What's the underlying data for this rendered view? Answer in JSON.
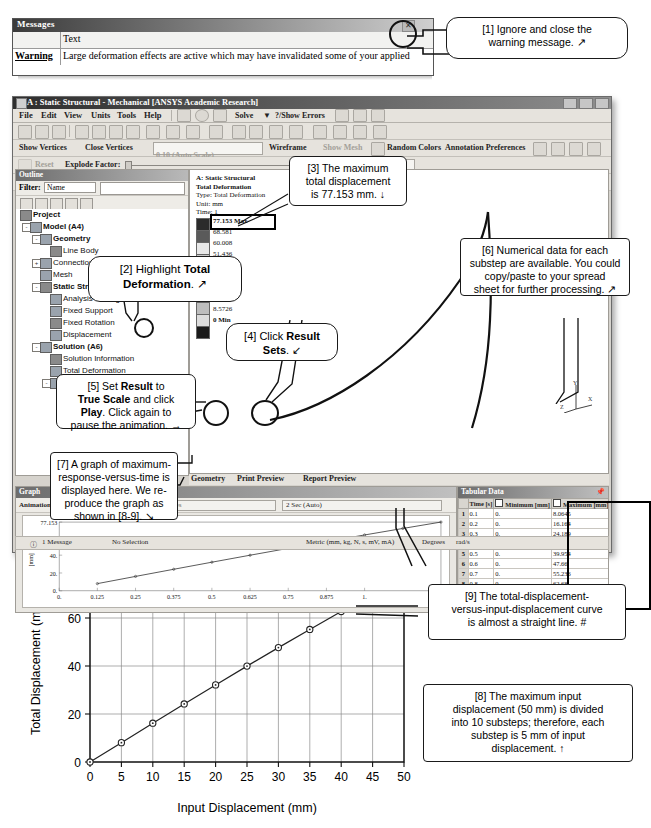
{
  "message_window": {
    "title": "Messages",
    "close_icon": "close-icon",
    "column_header_blank": "",
    "column_header_text": "Text",
    "row_type": "Warning",
    "row_text": "Large deformation effects are active which may have invalidated some of your applied"
  },
  "ansys": {
    "title": "A : Static Structural - Mechanical [ANSYS Academic Research]",
    "window_buttons": [
      "minimize",
      "maximize",
      "close"
    ],
    "menu": [
      "File",
      "Edit",
      "View",
      "Units",
      "Tools",
      "Help"
    ],
    "toolbar1": [
      "Solve",
      "?/Show Errors",
      "Worksheet"
    ],
    "toolbar2": [
      "Show Vertices",
      "Close Vertices",
      "0.10 (Auto Scale)",
      "Wireframe",
      "Show Mesh",
      "Random Colors",
      "Annotation Preferences"
    ],
    "toolbar3": [
      "Reset",
      "Explode Factor:",
      "Assembly Center"
    ],
    "toolbar4": [
      "Result",
      "1.0 (True Scale)",
      "Probe",
      "Display"
    ],
    "tree": {
      "filter_label": "Filter:",
      "filter_value": "Name",
      "items": [
        {
          "label": "Project",
          "depth": 0,
          "expander": "",
          "icon": "project-icon",
          "bold": true
        },
        {
          "label": "Model (A4)",
          "depth": 1,
          "expander": "-",
          "icon": "model-icon",
          "bold": true
        },
        {
          "label": "Geometry",
          "depth": 2,
          "expander": "-",
          "icon": "geometry-icon",
          "bold": true
        },
        {
          "label": "Line Body",
          "depth": 3,
          "expander": "",
          "icon": "body-icon",
          "bold": false
        },
        {
          "label": "Connections",
          "depth": 2,
          "expander": "+",
          "icon": "connections-icon",
          "bold": false
        },
        {
          "label": "Mesh",
          "depth": 2,
          "expander": "",
          "icon": "mesh-icon",
          "bold": false
        },
        {
          "label": "Static Structural (A5)",
          "depth": 2,
          "expander": "-",
          "icon": "environment-icon",
          "bold": true
        },
        {
          "label": "Analysis Settings",
          "depth": 3,
          "expander": "",
          "icon": "settings-icon",
          "bold": false
        },
        {
          "label": "Fixed Support",
          "depth": 3,
          "expander": "",
          "icon": "support-icon",
          "bold": false
        },
        {
          "label": "Fixed Rotation",
          "depth": 3,
          "expander": "",
          "icon": "rotation-icon",
          "bold": false
        },
        {
          "label": "Displacement",
          "depth": 3,
          "expander": "",
          "icon": "displacement-icon",
          "bold": false
        },
        {
          "label": "Solution (A6)",
          "depth": 2,
          "expander": "-",
          "icon": "solution-icon",
          "bold": true
        },
        {
          "label": "Solution Information",
          "depth": 3,
          "expander": "",
          "icon": "info-icon",
          "bold": false
        },
        {
          "label": "Total Deformation",
          "depth": 3,
          "expander": "",
          "icon": "result-icon",
          "bold": false
        },
        {
          "label": "Beam Tool",
          "depth": 3,
          "expander": "-",
          "icon": "beamtool-icon",
          "bold": false
        },
        {
          "label": "Direct Stress",
          "depth": 4,
          "expander": "",
          "icon": "result-icon",
          "bold": false
        },
        {
          "label": "Minimum Combined Stress",
          "depth": 4,
          "expander": "",
          "icon": "result-icon",
          "bold": false
        }
      ]
    },
    "graphics": {
      "header_lines": [
        "A: Static Structural",
        "Total Deformation",
        "Type: Total Deformation",
        "Unit: mm",
        "Time: 1"
      ],
      "legend_values": [
        "77.153 Max",
        "68.581",
        "60.008",
        "51.436",
        "42.863",
        "34.29",
        "25.718",
        "17.145",
        "8.5726",
        "0 Min"
      ],
      "triad": [
        "Y",
        "Z",
        "X"
      ],
      "tabs": [
        "Geometry",
        "Print Preview",
        "Report Preview"
      ]
    },
    "graph_panel": {
      "title": "Graph",
      "anim_label": "Animation",
      "frames_value": "20 Frames",
      "duration_value": "2 Sec (Auto)",
      "y_ticks": [
        "77.153",
        "60.",
        "40.",
        "20.",
        "0."
      ],
      "y_axis_title": "[mm]",
      "x_ticks": [
        "0.",
        "0.125",
        "0.25",
        "0.375",
        "0.5",
        "0.625",
        "0.75",
        "0.875",
        "1."
      ]
    },
    "tabular": {
      "title": "Tabular Data",
      "pin_icon": "pin-icon",
      "columns": [
        "",
        "Time [s]",
        "Minimum [mm]",
        "Maximum [mm]"
      ],
      "rows": [
        [
          "1",
          "0.1",
          "0.",
          "8.0645"
        ],
        [
          "2",
          "0.2",
          "0.",
          "16.164"
        ],
        [
          "3",
          "0.3",
          "0.",
          "24.189"
        ],
        [
          "4",
          "0.4",
          "0.",
          "32.126"
        ],
        [
          "5",
          "0.5",
          "0.",
          "39.954"
        ],
        [
          "6",
          "0.6",
          "0.",
          "47.66"
        ],
        [
          "7",
          "0.7",
          "0.",
          "55.236"
        ],
        [
          "8",
          "0.8",
          "0.",
          "62.68"
        ],
        [
          "9",
          "0.9",
          "0.",
          "69.986"
        ],
        [
          "10",
          "1.",
          "0.",
          "77.153"
        ]
      ]
    },
    "status_bar": {
      "messages": "1 Message",
      "selection": "No Selection",
      "units": "Metric (mm, kg, N, s, mV, mA)",
      "angle": "Degrees",
      "rotation": "rad/s"
    }
  },
  "callouts": [
    {
      "id": "1",
      "html": "[1] Ignore and close the<br>warning message. &#x2197;"
    },
    {
      "id": "2",
      "html": "[2] Highlight <b>Total<br>Deformation</b>. &#x2197;"
    },
    {
      "id": "3",
      "html": "[3] The maximum<br>total displacement<br>is 77.153 mm. &#x2193;"
    },
    {
      "id": "4",
      "html": "[4] Click <b>Result<br>Sets</b>. &#x2199;"
    },
    {
      "id": "5",
      "html": "[5] Set <b>Result</b> to<br><b>True Scale</b> and click<br><b>Play</b>. Click again to<br>pause the animation. &#x2192;"
    },
    {
      "id": "6",
      "html": "[6] Numerical data for each<br>substep are available. You could<br>copy/paste to your spread<br>sheet for further processing. &#x2197;"
    },
    {
      "id": "7",
      "html": "[7] A graph of maximum-<br>response-versus-time is<br>displayed here. We re-<br>produce the graph as<br>shown in [8-9]. &#x2198;"
    },
    {
      "id": "8",
      "html": "[8] The maximum input<br>displacement (50 mm) is divided<br>into 10 substeps; therefore, each<br>substep is 5 mm of input<br>displacement. &#x2191;"
    },
    {
      "id": "9",
      "html": "[9] The total-displacement-<br>versus-input-displacement curve<br>is almost a straight line. #"
    }
  ],
  "chart_data": {
    "type": "line",
    "title": "",
    "xlabel": "Input Displacement (mm)",
    "ylabel": "Total Displacement (mm)",
    "x": [
      0,
      5,
      10,
      15,
      20,
      25,
      30,
      35,
      40,
      45,
      50
    ],
    "values": [
      0,
      8.0645,
      16.164,
      24.189,
      32.126,
      39.954,
      47.66,
      55.236,
      62.68,
      69.986,
      77.153
    ],
    "xlim": [
      0,
      50
    ],
    "ylim": [
      0,
      80
    ],
    "xticks": [
      0,
      5,
      10,
      15,
      20,
      25,
      30,
      35,
      40,
      45,
      50
    ],
    "yticks": [
      0,
      20,
      40,
      60,
      80
    ],
    "grid": true,
    "marker": "circle",
    "legend": null
  }
}
